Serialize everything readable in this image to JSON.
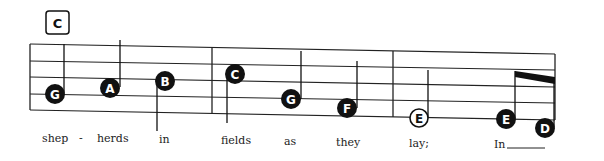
{
  "section": {
    "label": "C"
  },
  "staff": {
    "lines": 5,
    "barlines": 4
  },
  "notes": [
    {
      "name": "G",
      "filled": true,
      "stem": "up"
    },
    {
      "name": "A",
      "filled": true,
      "stem": "up"
    },
    {
      "name": "B",
      "filled": true,
      "stem": "down"
    },
    {
      "name": "C",
      "filled": true,
      "stem": "down"
    },
    {
      "name": "G",
      "filled": true,
      "stem": "up"
    },
    {
      "name": "F",
      "filled": true,
      "stem": "up"
    },
    {
      "name": "E",
      "filled": false,
      "stem": "up"
    },
    {
      "name": "E",
      "filled": true,
      "stem": "up",
      "beamed": true
    },
    {
      "name": "D",
      "filled": true,
      "stem": "up",
      "beamed": true
    }
  ],
  "lyrics": [
    "shep",
    "-",
    "herds",
    "in",
    "fields",
    "as",
    "they",
    "lay;",
    "In"
  ],
  "colors": {
    "ink": "#111111",
    "background": "#ffffff"
  }
}
